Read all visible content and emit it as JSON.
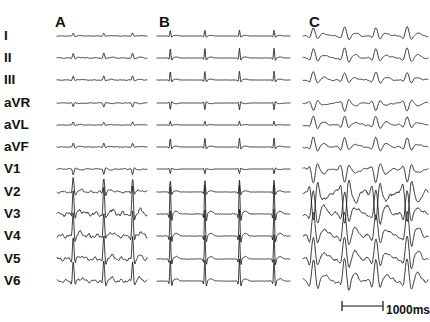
{
  "figure": {
    "background_color": "#ffffff",
    "trace_color": "#1a1a1a",
    "label_color": "#111111",
    "width": 430,
    "height": 322
  },
  "panels": [
    {
      "letter": "A",
      "x": 55,
      "y": 14,
      "trace_x0": 57,
      "trace_x1": 147
    },
    {
      "letter": "B",
      "x": 159,
      "y": 14,
      "trace_x0": 157,
      "trace_x1": 290
    },
    {
      "letter": "C",
      "x": 309,
      "y": 14,
      "trace_x0": 303,
      "trace_x1": 428
    }
  ],
  "leads": [
    {
      "name": "I",
      "y": 36
    },
    {
      "name": "II",
      "y": 58
    },
    {
      "name": "III",
      "y": 80
    },
    {
      "name": "aVR",
      "y": 103
    },
    {
      "name": "aVL",
      "y": 125
    },
    {
      "name": "aVF",
      "y": 147
    },
    {
      "name": "V1",
      "y": 169
    },
    {
      "name": "V2",
      "y": 192
    },
    {
      "name": "V3",
      "y": 214
    },
    {
      "name": "V4",
      "y": 236
    },
    {
      "name": "V5",
      "y": 259
    },
    {
      "name": "V6",
      "y": 281
    }
  ],
  "scalebar": {
    "label": "1000ms",
    "x_start": 342,
    "x_end": 383,
    "y": 306,
    "text_x": 386,
    "text_y": 310,
    "tick_height": 5
  },
  "chart_data": {
    "type": "line",
    "xlabel": "time",
    "ylabel": "amplitude",
    "grid": false,
    "legend": null,
    "time_scale_ms": 1000,
    "time_scale_px": 41,
    "lead_order": [
      "I",
      "II",
      "III",
      "aVR",
      "aVL",
      "aVF",
      "V1",
      "V2",
      "V3",
      "V4",
      "V5",
      "V6"
    ],
    "panels": [
      {
        "name": "A",
        "description": "Low amplitude irregular complexes with fibrillatory baseline; 3 wide QRS in precordial leads",
        "beats": 3,
        "beat_positions_frac": [
          0.18,
          0.52,
          0.84
        ],
        "baseline_noise": true,
        "lead_amplitudes": {
          "I": 3,
          "II": 5,
          "III": 4,
          "aVR": -4,
          "aVL": 3,
          "aVF": 4,
          "V1": -6,
          "V2": 14,
          "V3": 22,
          "V4": 20,
          "V5": 18,
          "V6": 16
        }
      },
      {
        "name": "B",
        "description": "Regular narrow sharp spikes on flat baseline; 4 beats, tall precordial QRS",
        "beats": 4,
        "beat_positions_frac": [
          0.1,
          0.36,
          0.62,
          0.88
        ],
        "baseline_noise": false,
        "lead_amplitudes": {
          "I": 6,
          "II": 10,
          "III": 9,
          "aVR": -7,
          "aVL": 4,
          "aVF": 9,
          "V1": -5,
          "V2": 12,
          "V3": 24,
          "V4": 22,
          "V5": 20,
          "V6": 18
        }
      },
      {
        "name": "C",
        "description": "Wide bizarre broad complexes, large deflections, deep downstrokes in precordial leads",
        "beats": 4,
        "beat_positions_frac": [
          0.08,
          0.33,
          0.58,
          0.83
        ],
        "baseline_noise": true,
        "lead_amplitudes": {
          "I": 9,
          "II": 10,
          "III": 8,
          "aVR": -8,
          "aVL": 9,
          "aVF": 10,
          "V1": -14,
          "V2": -20,
          "V3": 16,
          "V4": 16,
          "V5": 15,
          "V6": 15
        }
      }
    ]
  }
}
